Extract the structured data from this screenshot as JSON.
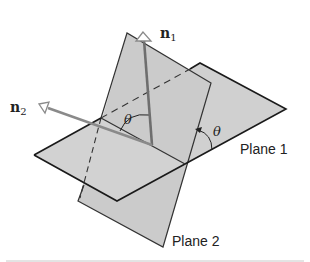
{
  "diagram": {
    "labels": {
      "n1": "n",
      "n1_sub": "1",
      "n2": "n",
      "n2_sub": "2",
      "theta_normals": "θ",
      "theta_planes": "θ",
      "plane1": "Plane 1",
      "plane2": "Plane 2"
    },
    "colors": {
      "plane_fill": "#d0d0d0",
      "edge": "#1a1a1a",
      "normal_vector": "#7a7a7a",
      "background": "#ffffff",
      "separator": "#c8c8c8"
    }
  }
}
